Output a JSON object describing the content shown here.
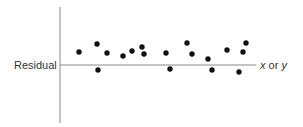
{
  "chart_data": {
    "type": "scatter",
    "title": "",
    "xlabel": "x or y",
    "ylabel": "Residual",
    "xlabel_parts": {
      "var1": "x",
      "conj": " or ",
      "var2": "y"
    },
    "grid": false,
    "legend": null,
    "axes": {
      "origin_px": [
        60,
        65
      ],
      "y_axis_px": {
        "top": 7,
        "bottom": 123
      },
      "x_axis_px": {
        "left": 60,
        "right": 256
      }
    },
    "note": "Residual plot: points randomly scattered around zero line; x in pixel units from y-axis, residual in pixel units above (+) / below (-) the zero line",
    "points": [
      {
        "x": 19,
        "residual": 13
      },
      {
        "x": 37,
        "residual": 21
      },
      {
        "x": 38,
        "residual": -5
      },
      {
        "x": 47,
        "residual": 12
      },
      {
        "x": 63,
        "residual": 9
      },
      {
        "x": 72,
        "residual": 14
      },
      {
        "x": 82,
        "residual": 18
      },
      {
        "x": 84,
        "residual": 11
      },
      {
        "x": 106,
        "residual": 12
      },
      {
        "x": 110,
        "residual": -4
      },
      {
        "x": 127,
        "residual": 22
      },
      {
        "x": 132,
        "residual": 11
      },
      {
        "x": 148,
        "residual": 6
      },
      {
        "x": 152,
        "residual": -5
      },
      {
        "x": 167,
        "residual": 15
      },
      {
        "x": 179,
        "residual": -7
      },
      {
        "x": 183,
        "residual": 13
      },
      {
        "x": 186,
        "residual": 22
      }
    ],
    "style": {
      "point_color": "#111111",
      "axis_color": "#888888",
      "point_radius": 2.7
    }
  }
}
